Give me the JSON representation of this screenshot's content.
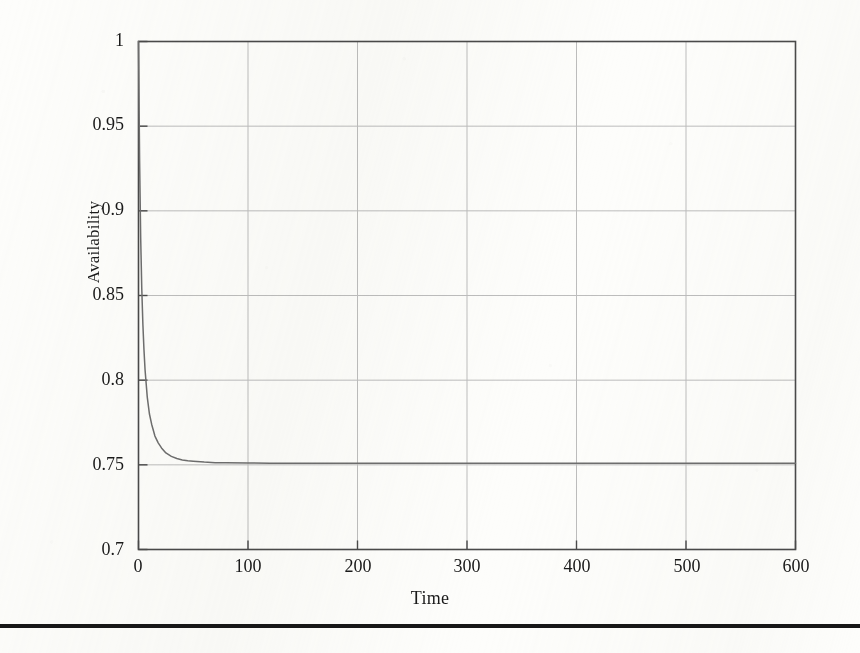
{
  "figure": {
    "background_color": "#fdfdfb",
    "frame_color": "#4a4a4a",
    "grid_color": "#bdbdbd",
    "curve_color": "#6e6e6e",
    "rule_color": "#171717"
  },
  "chart_data": {
    "type": "line",
    "title": "",
    "subtitle": "",
    "xlabel": "Time",
    "ylabel": "Availability",
    "xlim": [
      0,
      600
    ],
    "ylim": [
      0.7,
      1
    ],
    "grid": true,
    "legend": null,
    "legend_position": "none",
    "xticks": [
      0,
      100,
      200,
      300,
      400,
      500,
      600
    ],
    "xtick_labels": [
      "0",
      "100",
      "200",
      "300",
      "400",
      "500",
      "600"
    ],
    "yticks": [
      0.7,
      0.75,
      0.8,
      0.85,
      0.9,
      0.95,
      1
    ],
    "ytick_labels": [
      "0.7",
      "0.75",
      "0.8",
      "0.85",
      "0.9",
      "0.95",
      "1"
    ],
    "gridlines_x": [
      100,
      200,
      300,
      400,
      500
    ],
    "gridlines_y": [
      0.75,
      0.8,
      0.85,
      0.9,
      0.95
    ],
    "asymptote": 0.751,
    "annotations": [],
    "series": [
      {
        "name": "Availability",
        "x": [
          0,
          1,
          2,
          3,
          4,
          5,
          6,
          8,
          10,
          12,
          15,
          18,
          21,
          25,
          30,
          35,
          40,
          45,
          50,
          60,
          70,
          80,
          100,
          120,
          150,
          200,
          250,
          300,
          350,
          400,
          450,
          500,
          550,
          600
        ],
        "y": [
          1.0,
          0.93,
          0.884,
          0.854,
          0.833,
          0.818,
          0.806,
          0.79,
          0.78,
          0.774,
          0.767,
          0.763,
          0.76,
          0.757,
          0.755,
          0.7537,
          0.7529,
          0.7524,
          0.7521,
          0.7516,
          0.7513,
          0.7512,
          0.7511,
          0.751,
          0.751,
          0.751,
          0.751,
          0.751,
          0.751,
          0.751,
          0.751,
          0.751,
          0.751,
          0.751
        ]
      }
    ]
  },
  "ytick_positions": [
    41,
    125,
    210,
    295,
    380,
    465,
    550
  ],
  "xtick_positions": [
    138,
    248,
    358,
    467,
    577,
    687,
    796
  ]
}
